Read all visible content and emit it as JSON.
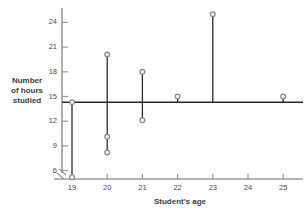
{
  "chart_data": {
    "type": "scatter",
    "title": "",
    "xlabel": "Student's age",
    "ylabel": "Number\nof hours\nstudied",
    "xlim": [
      18.5,
      25.5
    ],
    "ylim": [
      4.2,
      25.6
    ],
    "xticks": [
      19,
      20,
      21,
      22,
      23,
      24,
      25
    ],
    "yticks": [
      6,
      9,
      12,
      15,
      18,
      21,
      24
    ],
    "grid": false,
    "axis_break_x": true,
    "mean_line": 14.3,
    "mean_line_label": "",
    "marker_color": "#8a8a8a",
    "line_color": "#2b2b2b",
    "axis_color": "#9a9a9a",
    "points": [
      {
        "x": 19,
        "y": 14.3
      },
      {
        "x": 19,
        "y": 5.2
      },
      {
        "x": 20,
        "y": 20.1
      },
      {
        "x": 20,
        "y": 10.1
      },
      {
        "x": 20,
        "y": 8.2
      },
      {
        "x": 21,
        "y": 18.0
      },
      {
        "x": 21,
        "y": 12.1
      },
      {
        "x": 22,
        "y": 15.0
      },
      {
        "x": 23,
        "y": 25.0
      },
      {
        "x": 25,
        "y": 15.0
      }
    ],
    "segments": [
      {
        "x": 19,
        "y_low": 5.2,
        "y_high": 14.3
      },
      {
        "x": 20,
        "y_low": 8.2,
        "y_high": 20.1
      },
      {
        "x": 21,
        "y_low": 12.1,
        "y_high": 18.0
      },
      {
        "x": 22,
        "y_low": 14.3,
        "y_high": 15.0
      },
      {
        "x": 23,
        "y_low": 14.3,
        "y_high": 25.0
      },
      {
        "x": 25,
        "y_low": 14.3,
        "y_high": 15.0
      }
    ]
  },
  "axis_labels": {
    "y": [
      "24",
      "21",
      "18",
      "15",
      "12",
      "9",
      "6"
    ],
    "x": [
      "19",
      "20",
      "21",
      "22",
      "23",
      "24",
      "25"
    ]
  },
  "titles": {
    "y_axis": "Number\nof hours\nstudied",
    "x_axis": "Student's age"
  }
}
